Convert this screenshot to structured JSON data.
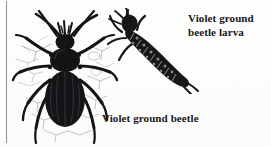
{
  "figure": {
    "kind": "natural-history-engraving",
    "background_color": "#fdfdfc",
    "ink_color": "#17161a",
    "twig_color": "#8d8d8d",
    "margin_rule_color": "#8e8e8e"
  },
  "captions": {
    "larva": "Violet ground\nbeetle larva",
    "beetle": "Violet ground beetle"
  },
  "illustrations": {
    "beetle": {
      "name": "violet-ground-beetle",
      "view": "dorsal",
      "description": "Violet ground beetle"
    },
    "larva": {
      "name": "violet-ground-beetle-larva",
      "view": "dorsolateral",
      "description": "Violet ground beetle larva"
    }
  },
  "icons": {
    "margin_rule": "vertical-rule-icon"
  }
}
